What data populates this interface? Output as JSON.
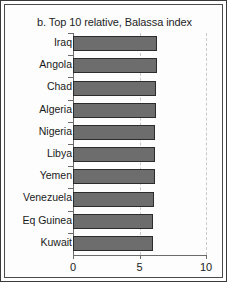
{
  "chart_data": {
    "type": "bar",
    "orientation": "horizontal",
    "title": "b. Top 10 relative, Balassa index",
    "xlabel": "",
    "ylabel": "",
    "categories": [
      "Iraq",
      "Angola",
      "Chad",
      "Algeria",
      "Nigeria",
      "Libya",
      "Yemen",
      "Venezuela",
      "Eq Guinea",
      "Kuwait"
    ],
    "values": [
      6.35,
      6.3,
      6.25,
      6.25,
      6.2,
      6.15,
      6.15,
      6.1,
      6.05,
      6.0
    ],
    "xlim": [
      0,
      10
    ],
    "xticks": [
      0,
      5,
      10
    ],
    "xticklabels": [
      "0",
      "5",
      "10"
    ],
    "grid": true,
    "gridlines": [
      5,
      10
    ],
    "legend": null,
    "bar_color": "#6d6d6d",
    "bar_edge_color": "#2c2c2c",
    "gridline_color": "#c9c9c9",
    "axis_color": "#6b6b6b"
  }
}
